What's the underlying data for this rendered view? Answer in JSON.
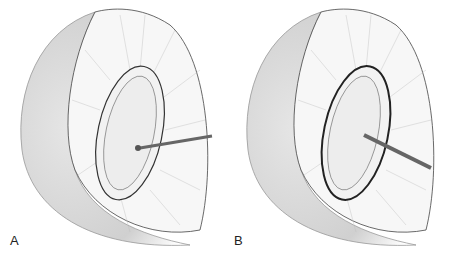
{
  "figure": {
    "panels": [
      {
        "label": "A",
        "description": "Probe tip at margin of oval structure"
      },
      {
        "label": "B",
        "description": "Instrument inserted separating oval structure from surrounding tissue"
      }
    ]
  },
  "colors": {
    "background": "#ffffff",
    "shade": "#c8c8c8",
    "line": "#333333"
  }
}
